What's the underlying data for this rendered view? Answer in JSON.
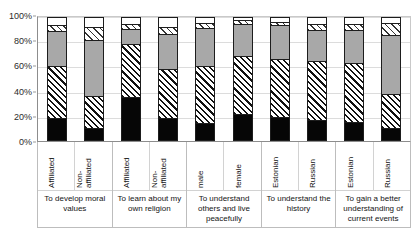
{
  "chart_data": {
    "type": "bar",
    "subtype": "100% stacked bar",
    "title": "",
    "xlabel": "",
    "ylabel": "",
    "ylim": [
      0,
      100
    ],
    "yticks": [
      "0%",
      "20%",
      "40%",
      "60%",
      "80%",
      "100%"
    ],
    "ytick_values": [
      0,
      20,
      40,
      60,
      80,
      100
    ],
    "grid": true,
    "legend": "none",
    "categories": [
      "Affiliated",
      "Non-affiliated",
      "Affiliated",
      "Non-affiliated",
      "male",
      "female",
      "Estonian",
      "Russian",
      "Estonian",
      "Russian"
    ],
    "groups": [
      {
        "title": "To develop moral values",
        "subcategories": [
          "Affiliated",
          "Non-\naffiliated"
        ]
      },
      {
        "title": "To learn about my own religion",
        "subcategories": [
          "Affiliated",
          "Non-\naffiliated"
        ]
      },
      {
        "title": "To understand others and live peacefully",
        "subcategories": [
          "male",
          "female"
        ]
      },
      {
        "title": "To understand the history",
        "subcategories": [
          "Estonian",
          "Russian"
        ]
      },
      {
        "title": "To gain a better understanding of current events",
        "subcategories": [
          "Estonian",
          "Russian"
        ]
      }
    ],
    "series": [
      {
        "name": "segment-1-black",
        "pattern": "solid-black",
        "values": [
          18,
          10,
          35,
          18,
          14,
          21,
          19,
          16,
          15,
          10
        ]
      },
      {
        "name": "segment-2-hatch",
        "pattern": "dense-diagonal-hatch",
        "values": [
          43,
          26,
          44,
          40,
          47,
          48,
          47,
          49,
          48,
          28
        ]
      },
      {
        "name": "segment-3-gray",
        "pattern": "solid-gray",
        "values": [
          28,
          46,
          12,
          29,
          31,
          26,
          28,
          25,
          27,
          48
        ]
      },
      {
        "name": "segment-4-hatch-light",
        "pattern": "light-diagonal-hatch",
        "values": [
          5,
          11,
          4,
          6,
          4,
          3,
          3,
          5,
          5,
          10
        ]
      },
      {
        "name": "segment-5-white",
        "pattern": "white",
        "values": [
          6,
          7,
          5,
          7,
          4,
          2,
          3,
          5,
          5,
          4
        ]
      }
    ],
    "bars": [
      {
        "label": "Affiliated",
        "group": "To develop moral values",
        "black": 18,
        "hatch": 43,
        "gray": 28,
        "hatch_light": 5,
        "white": 6
      },
      {
        "label": "Non-affiliated",
        "group": "To develop moral values",
        "black": 10,
        "hatch": 26,
        "gray": 46,
        "hatch_light": 11,
        "white": 7
      },
      {
        "label": "Affiliated",
        "group": "To learn about my own religion",
        "black": 35,
        "hatch": 44,
        "gray": 12,
        "hatch_light": 4,
        "white": 5
      },
      {
        "label": "Non-affiliated",
        "group": "To learn about my own religion",
        "black": 18,
        "hatch": 40,
        "gray": 29,
        "hatch_light": 6,
        "white": 7
      },
      {
        "label": "male",
        "group": "To understand others and live peacefully",
        "black": 14,
        "hatch": 47,
        "gray": 31,
        "hatch_light": 4,
        "white": 4
      },
      {
        "label": "female",
        "group": "To understand others and live peacefully",
        "black": 21,
        "hatch": 48,
        "gray": 26,
        "hatch_light": 3,
        "white": 2
      },
      {
        "label": "Estonian",
        "group": "To understand the history",
        "black": 19,
        "hatch": 47,
        "gray": 28,
        "hatch_light": 3,
        "white": 3
      },
      {
        "label": "Russian",
        "group": "To understand the history",
        "black": 16,
        "hatch": 49,
        "gray": 25,
        "hatch_light": 5,
        "white": 5
      },
      {
        "label": "Estonian",
        "group": "To gain a better understanding of current events",
        "black": 15,
        "hatch": 48,
        "gray": 27,
        "hatch_light": 5,
        "white": 5
      },
      {
        "label": "Russian",
        "group": "To gain a better understanding of current events",
        "black": 10,
        "hatch": 28,
        "gray": 48,
        "hatch_light": 10,
        "white": 4
      }
    ]
  }
}
